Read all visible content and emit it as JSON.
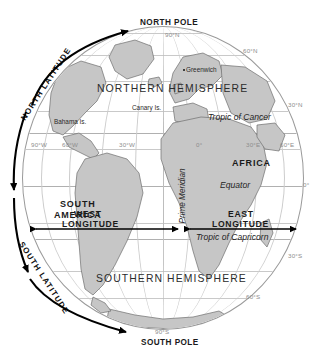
{
  "figure": {
    "type": "geographic-diagram"
  },
  "poles": {
    "north": {
      "label": "NORTH POLE",
      "coordinate": "90°N"
    },
    "south": {
      "label": "SOUTH POLE",
      "coordinate": "90°S"
    }
  },
  "hemispheres": {
    "north": "NORTHERN HEMISPHERE",
    "south": "SOUTHERN HEMISPHERE"
  },
  "axis_labels": {
    "north_latitude": "NORTH LATITUDE",
    "south_latitude": "SOUTH LATITUDE",
    "west_longitude_line1": "WEST",
    "west_longitude_line2": "LONGITUDE",
    "east_longitude_line1": "EAST",
    "east_longitude_line2": "LONGITUDE",
    "prime_meridian": "Prime Meridian"
  },
  "special_parallels": {
    "tropic_of_cancer": "Tropic of Cancer",
    "equator": "Equator",
    "tropic_of_capricorn": "Tropic of Capricorn"
  },
  "places": {
    "continent_south_america_line1": "SOUTH",
    "continent_south_america_line2": "AMERICA",
    "continent_africa": "AFRICA",
    "greenwich": "Greenwich",
    "bahama_islands": "Bahama Is.",
    "canary_islands": "Canary Is."
  },
  "latitude_ticks": [
    {
      "label": "90°N",
      "value": 90
    },
    {
      "label": "60°N",
      "value": 60
    },
    {
      "label": "30°N",
      "value": 30
    },
    {
      "label": "0°",
      "value": 0
    },
    {
      "label": "30°S",
      "value": -30
    },
    {
      "label": "60°S",
      "value": -60
    },
    {
      "label": "90°S",
      "value": -90
    }
  ],
  "longitude_ticks": [
    {
      "label": "90°W",
      "value": -90
    },
    {
      "label": "60°W",
      "value": -60
    },
    {
      "label": "30°W",
      "value": -30
    },
    {
      "label": "0°",
      "value": 0
    },
    {
      "label": "30°E",
      "value": 30
    },
    {
      "label": "60°E",
      "value": 60
    }
  ],
  "colors": {
    "land": "#c6c6c6",
    "land_outline": "#6f6f6f",
    "grid": "#c9c9c9",
    "outline": "#9a9a9a",
    "text": "#1a1a1a",
    "grid_text": "#8d8d8d",
    "background": "#ffffff"
  }
}
